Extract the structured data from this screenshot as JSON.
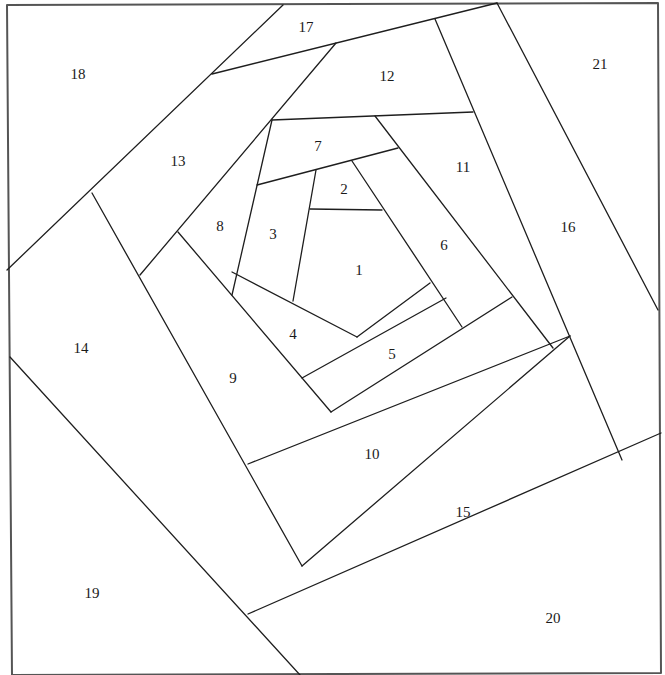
{
  "diagram": {
    "title": "",
    "type": "pineapple / log-cabin spiral paper-piecing pattern",
    "stroke_color": "#1e1e1e",
    "background": "#ffffff",
    "border": [
      [
        7,
        5
      ],
      [
        658,
        3
      ],
      [
        661,
        673
      ],
      [
        12,
        675
      ]
    ],
    "segments": [
      [
        [
          283,
          5
        ],
        [
          7,
          270
        ]
      ],
      [
        [
          212,
          74
        ],
        [
          497,
          3
        ]
      ],
      [
        [
          336,
          43
        ],
        [
          140,
          275
        ]
      ],
      [
        [
          272,
          120
        ],
        [
          473,
          112
        ]
      ],
      [
        [
          435,
          19
        ],
        [
          622,
          460
        ]
      ],
      [
        [
          497,
          3
        ],
        [
          658,
          310
        ]
      ],
      [
        [
          375,
          116
        ],
        [
          553,
          348
        ]
      ],
      [
        [
          257,
          185
        ],
        [
          398,
          148
        ]
      ],
      [
        [
          272,
          120
        ],
        [
          232,
          295
        ]
      ],
      [
        [
          316,
          170
        ],
        [
          293,
          301
        ]
      ],
      [
        [
          310,
          209
        ],
        [
          382,
          210
        ]
      ],
      [
        [
          352,
          161
        ],
        [
          462,
          327
        ]
      ],
      [
        [
          232,
          272
        ],
        [
          357,
          337
        ]
      ],
      [
        [
          357,
          337
        ],
        [
          430,
          283
        ]
      ],
      [
        [
          302,
          378
        ],
        [
          446,
          298
        ]
      ],
      [
        [
          178,
          232
        ],
        [
          331,
          412
        ]
      ],
      [
        [
          331,
          412
        ],
        [
          512,
          297
        ]
      ],
      [
        [
          92,
          193
        ],
        [
          302,
          566
        ]
      ],
      [
        [
          248,
          464
        ],
        [
          570,
          336
        ]
      ],
      [
        [
          10,
          357
        ],
        [
          300,
          675
        ]
      ],
      [
        [
          302,
          566
        ],
        [
          570,
          336
        ]
      ],
      [
        [
          248,
          614
        ],
        [
          661,
          433
        ]
      ]
    ],
    "pieces": [
      {
        "id": "1",
        "x": 359,
        "y": 270
      },
      {
        "id": "2",
        "x": 344,
        "y": 189
      },
      {
        "id": "3",
        "x": 273,
        "y": 234
      },
      {
        "id": "4",
        "x": 293,
        "y": 334
      },
      {
        "id": "5",
        "x": 392,
        "y": 354
      },
      {
        "id": "6",
        "x": 444,
        "y": 245
      },
      {
        "id": "7",
        "x": 318,
        "y": 146
      },
      {
        "id": "8",
        "x": 220,
        "y": 226
      },
      {
        "id": "9",
        "x": 233,
        "y": 378
      },
      {
        "id": "10",
        "x": 372,
        "y": 454
      },
      {
        "id": "11",
        "x": 463,
        "y": 167
      },
      {
        "id": "12",
        "x": 387,
        "y": 76
      },
      {
        "id": "13",
        "x": 178,
        "y": 161
      },
      {
        "id": "14",
        "x": 81,
        "y": 348
      },
      {
        "id": "15",
        "x": 463,
        "y": 512
      },
      {
        "id": "16",
        "x": 568,
        "y": 227
      },
      {
        "id": "17",
        "x": 306,
        "y": 27
      },
      {
        "id": "18",
        "x": 78,
        "y": 74
      },
      {
        "id": "19",
        "x": 92,
        "y": 593
      },
      {
        "id": "20",
        "x": 553,
        "y": 618
      },
      {
        "id": "21",
        "x": 600,
        "y": 64
      }
    ]
  }
}
